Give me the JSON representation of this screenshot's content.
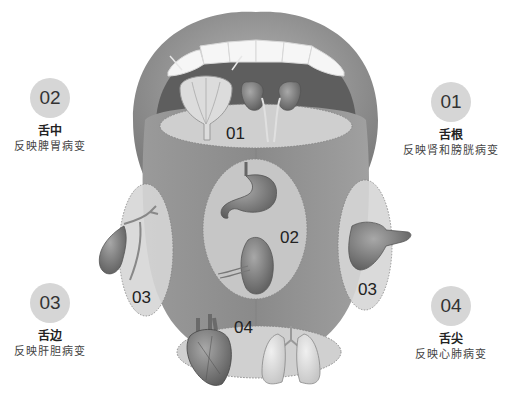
{
  "diagram": {
    "colors": {
      "badge": "#d6d6d6",
      "lip": "#9a9a9a",
      "mouth_cavity": "#6b6b6b",
      "tongue": "#8c8c8c",
      "zone_fill": "#c9c9c9",
      "teeth": "#f4f4f4"
    },
    "zones": [
      {
        "number": "01",
        "title": "舌根",
        "description": "反映肾和膀胱病变",
        "organs": [
          "bladder",
          "kidneys"
        ]
      },
      {
        "number": "02",
        "title": "舌中",
        "description": "反映脾胃病变",
        "organs": [
          "stomach",
          "spleen"
        ]
      },
      {
        "number": "03",
        "title": "舌边",
        "description": "反映肝胆病变",
        "organs": [
          "gallbladder",
          "liver"
        ]
      },
      {
        "number": "04",
        "title": "舌尖",
        "description": "反映心肺病变",
        "organs": [
          "heart",
          "lungs"
        ]
      }
    ],
    "on_tongue_labels": {
      "zone1": "01",
      "zone2": "02",
      "zone3_left": "03",
      "zone3_right": "03",
      "zone4": "04"
    }
  }
}
